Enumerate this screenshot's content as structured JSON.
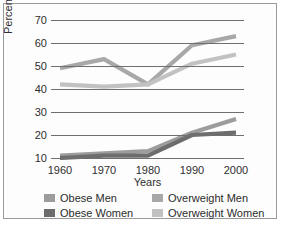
{
  "chart_data": {
    "type": "line",
    "title": "",
    "xlabel": "Years",
    "ylabel": "Percentage",
    "categories": [
      "1960",
      "1970",
      "1980",
      "1990",
      "2000"
    ],
    "x": [
      1960,
      1970,
      1980,
      1990,
      2000
    ],
    "ylim": [
      10,
      70
    ],
    "yticks": [
      10,
      20,
      30,
      40,
      50,
      60,
      70
    ],
    "xlim": [
      1960,
      2000
    ],
    "grid": "horizontal",
    "legend_position": "bottom",
    "series": [
      {
        "name": "Obese Men",
        "values": [
          11,
          12,
          13,
          21,
          27
        ],
        "color": "#9c9c9c"
      },
      {
        "name": "Obese Women",
        "values": [
          10,
          11,
          11,
          20,
          21
        ],
        "color": "#6d6d6d"
      },
      {
        "name": "Overweight Men",
        "values": [
          49,
          53,
          42,
          59,
          63
        ],
        "color": "#a8a8a8"
      },
      {
        "name": "Overweight Women",
        "values": [
          42,
          41,
          42,
          51,
          55
        ],
        "color": "#c2c2c2"
      }
    ]
  },
  "axes": {
    "ylabel": "Percentage",
    "xlabel": "Years",
    "yticks": [
      "70",
      "60",
      "50",
      "40",
      "30",
      "20",
      "10"
    ],
    "xticks": [
      "1960",
      "1970",
      "1980",
      "1990",
      "2000"
    ]
  },
  "legend": {
    "items": [
      {
        "label": "Obese Men",
        "color": "#9c9c9c"
      },
      {
        "label": "Overweight Men",
        "color": "#a8a8a8"
      },
      {
        "label": "Obese Women",
        "color": "#6d6d6d"
      },
      {
        "label": "Overweight Women",
        "color": "#c2c2c2"
      }
    ]
  },
  "colors": {
    "frame_border": "#9a9a9a",
    "background": "#fdfdfd",
    "gridline": "#6f6f6f",
    "text": "#2b2b2b"
  }
}
